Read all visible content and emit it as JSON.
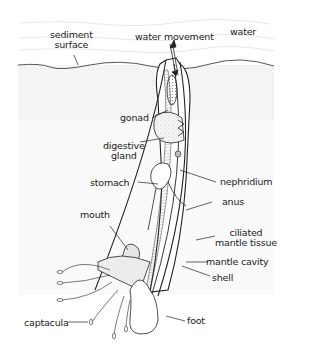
{
  "diagram": {
    "labels": {
      "sediment_surface_1": "sediment",
      "sediment_surface_2": "surface",
      "water_movement": "water movement",
      "water": "water",
      "gonad": "gonad",
      "digestive_gland_1": "digestive",
      "digestive_gland_2": "gland",
      "stomach": "stomach",
      "nephridium": "nephridium",
      "anus": "anus",
      "mouth": "mouth",
      "ciliated_mantle_tissue_1": "ciliated",
      "ciliated_mantle_tissue_2": "mantle tissue",
      "mantle_cavity": "mantle cavity",
      "shell": "shell",
      "captacula": "captacula",
      "foot": "foot"
    },
    "colors": {
      "ink": "#222222",
      "sediment": "#d9d9d9",
      "background": "#ffffff"
    }
  }
}
